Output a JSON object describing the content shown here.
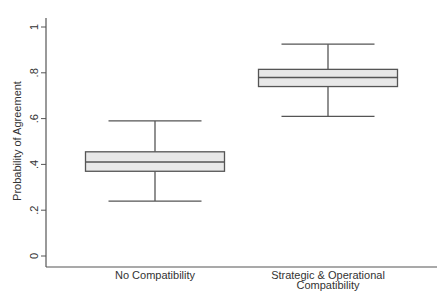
{
  "chart_data": {
    "type": "box",
    "title": "",
    "xlabel": "",
    "ylabel": "Probability of Agreement",
    "ylim": [
      0,
      1
    ],
    "yticks": [
      0,
      0.2,
      0.4,
      0.6,
      0.8,
      1
    ],
    "ytick_labels": [
      "0",
      ".2",
      ".4",
      ".6",
      ".8",
      "1"
    ],
    "grid": false,
    "legend": null,
    "categories": [
      "No Compatibility",
      "Strategic & Operational Compatibility"
    ],
    "category_label_lines": [
      [
        "No Compatibility"
      ],
      [
        "Strategic & Operational",
        "Compatibility"
      ]
    ],
    "series": [
      {
        "name": "No Compatibility",
        "whisker_low": 0.24,
        "q1": 0.37,
        "median": 0.41,
        "q3": 0.455,
        "whisker_high": 0.59
      },
      {
        "name": "Strategic & Operational Compatibility",
        "whisker_low": 0.61,
        "q1": 0.74,
        "median": 0.78,
        "q3": 0.815,
        "whisker_high": 0.925
      }
    ],
    "colors": {
      "box_fill": "#e8e8e8",
      "line": "#555555",
      "text": "#333333",
      "background": "#ffffff"
    }
  }
}
